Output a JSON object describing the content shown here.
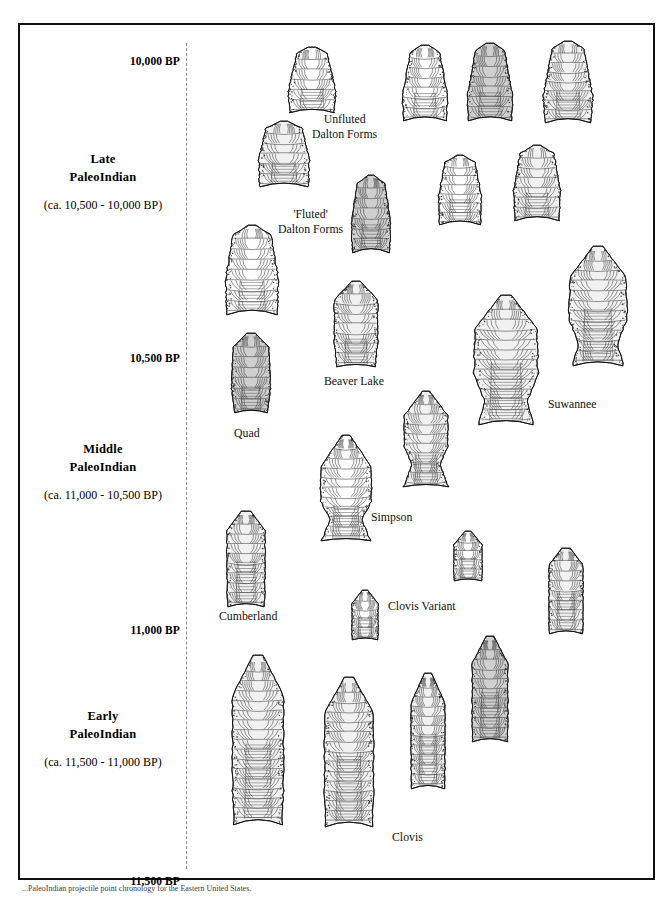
{
  "figure": {
    "caption": "...PaleoIndian projectile point chronology for the Eastern United States.",
    "axis_unit": "BP"
  },
  "axis": {
    "ticks": [
      {
        "label": "10,000 BP",
        "value": 10000,
        "y": 38
      },
      {
        "label": "10,500 BP",
        "value": 10500,
        "y": 335
      },
      {
        "label": "11,000 BP",
        "value": 11000,
        "y": 607
      },
      {
        "label": "11,500 BP",
        "value": 11500,
        "y": 858
      }
    ]
  },
  "periods": [
    {
      "id": "late",
      "name_line1": "Late",
      "name_line2": "PaleoIndian",
      "range": "(ca. 10,500 - 10,000 BP)",
      "start_bp": 10500,
      "end_bp": 10000,
      "top": 125
    },
    {
      "id": "middle",
      "name_line1": "Middle",
      "name_line2": "PaleoIndian",
      "range": "(ca. 11,000 - 10,500 BP)",
      "start_bp": 11000,
      "end_bp": 10500,
      "top": 415
    },
    {
      "id": "early",
      "name_line1": "Early",
      "name_line2": "PaleoIndian",
      "range": "(ca. 11,500 - 11,000 BP)",
      "start_bp": 11500,
      "end_bp": 11000,
      "top": 682
    }
  ],
  "point_labels": [
    {
      "id": "unfluted-dalton",
      "line1": "Unfluted",
      "line2": "Dalton Forms",
      "x": 310,
      "y": 110
    },
    {
      "id": "fluted-dalton",
      "line1": "'Fluted'",
      "line2": "Dalton Forms",
      "x": 276,
      "y": 205
    },
    {
      "id": "beaver-lake",
      "line1": "Beaver Lake",
      "line2": "",
      "x": 322,
      "y": 372
    },
    {
      "id": "quad",
      "line1": "Quad",
      "line2": "",
      "x": 232,
      "y": 424
    },
    {
      "id": "suwannee",
      "line1": "Suwannee",
      "line2": "",
      "x": 546,
      "y": 395
    },
    {
      "id": "simpson",
      "line1": "Simpson",
      "line2": "",
      "x": 369,
      "y": 508
    },
    {
      "id": "cumberland",
      "line1": "Cumberland",
      "line2": "",
      "x": 217,
      "y": 607
    },
    {
      "id": "clovis-variant",
      "line1": "Clovis Variant",
      "line2": "",
      "x": 386,
      "y": 597
    },
    {
      "id": "clovis",
      "line1": "Clovis",
      "line2": "",
      "x": 390,
      "y": 828
    }
  ],
  "artifacts": [
    {
      "id": "dalton-unfluted-1",
      "type": "dalton-unfluted",
      "group": "unfluted-dalton",
      "x": 285,
      "y": 44,
      "w": 50,
      "h": 68,
      "tone": "light"
    },
    {
      "id": "dalton-unfluted-2",
      "type": "dalton-unfluted",
      "group": "unfluted-dalton",
      "x": 399,
      "y": 42,
      "w": 48,
      "h": 78,
      "tone": "light"
    },
    {
      "id": "dalton-unfluted-3",
      "type": "dalton-unfluted",
      "group": "unfluted-dalton",
      "x": 464,
      "y": 40,
      "w": 48,
      "h": 80,
      "tone": "dark"
    },
    {
      "id": "dalton-unfluted-4",
      "type": "dalton-unfluted",
      "group": "unfluted-dalton",
      "x": 540,
      "y": 38,
      "w": 52,
      "h": 84,
      "tone": "mid"
    },
    {
      "id": "dalton-fluted-1",
      "type": "dalton-fluted",
      "group": "fluted-dalton",
      "x": 255,
      "y": 118,
      "w": 54,
      "h": 68,
      "tone": "mid"
    },
    {
      "id": "dalton-fluted-2",
      "type": "dalton-fluted",
      "group": "fluted-dalton",
      "x": 348,
      "y": 172,
      "w": 42,
      "h": 80,
      "tone": "dark"
    },
    {
      "id": "dalton-fluted-3",
      "type": "dalton-fluted",
      "group": "fluted-dalton",
      "x": 435,
      "y": 152,
      "w": 46,
      "h": 72,
      "tone": "light"
    },
    {
      "id": "dalton-fluted-4",
      "type": "dalton-fluted",
      "group": "fluted-dalton",
      "x": 510,
      "y": 142,
      "w": 50,
      "h": 78,
      "tone": "mid"
    },
    {
      "id": "dalton-large-1",
      "type": "dalton-fluted",
      "group": "fluted-dalton",
      "x": 222,
      "y": 222,
      "w": 56,
      "h": 92,
      "tone": "light"
    },
    {
      "id": "quad-1",
      "type": "quad",
      "group": "quad",
      "x": 228,
      "y": 330,
      "w": 42,
      "h": 82,
      "tone": "dark"
    },
    {
      "id": "beaver-lake-1",
      "type": "beaver-lake",
      "group": "beaver-lake",
      "x": 330,
      "y": 278,
      "w": 48,
      "h": 88,
      "tone": "mid"
    },
    {
      "id": "simpson-1",
      "type": "simpson",
      "group": "simpson",
      "x": 316,
      "y": 432,
      "w": 56,
      "h": 108,
      "tone": "light"
    },
    {
      "id": "simpson-2",
      "type": "simpson-waisted",
      "group": "simpson",
      "x": 400,
      "y": 388,
      "w": 48,
      "h": 98,
      "tone": "mid"
    },
    {
      "id": "suwannee-1",
      "type": "suwannee",
      "group": "suwannee",
      "x": 470,
      "y": 292,
      "w": 68,
      "h": 132,
      "tone": "mid"
    },
    {
      "id": "suwannee-2",
      "type": "suwannee",
      "group": "suwannee",
      "x": 565,
      "y": 243,
      "w": 62,
      "h": 122,
      "tone": "mid"
    },
    {
      "id": "cumberland-1",
      "type": "cumberland",
      "group": "cumberland",
      "x": 223,
      "y": 508,
      "w": 42,
      "h": 98,
      "tone": "mid"
    },
    {
      "id": "clovis-variant-1",
      "type": "clovis-small",
      "group": "clovis-variant",
      "x": 450,
      "y": 528,
      "w": 32,
      "h": 52,
      "tone": "light"
    },
    {
      "id": "clovis-variant-2",
      "type": "clovis-small",
      "group": "clovis-variant",
      "x": 348,
      "y": 587,
      "w": 30,
      "h": 52,
      "tone": "light"
    },
    {
      "id": "clovis-variant-3",
      "type": "cumberland",
      "group": "clovis-variant",
      "x": 545,
      "y": 545,
      "w": 38,
      "h": 88,
      "tone": "mid"
    },
    {
      "id": "clovis-1",
      "type": "clovis",
      "group": "clovis",
      "x": 228,
      "y": 652,
      "w": 56,
      "h": 172,
      "tone": "mid"
    },
    {
      "id": "clovis-2",
      "type": "clovis",
      "group": "clovis",
      "x": 320,
      "y": 674,
      "w": 54,
      "h": 152,
      "tone": "mid"
    },
    {
      "id": "clovis-3",
      "type": "clovis-narrow",
      "group": "clovis",
      "x": 407,
      "y": 670,
      "w": 38,
      "h": 118,
      "tone": "mid"
    },
    {
      "id": "clovis-4",
      "type": "clovis-narrow",
      "group": "clovis",
      "x": 468,
      "y": 633,
      "w": 40,
      "h": 108,
      "tone": "dark"
    }
  ],
  "colors": {
    "frame": "#111111",
    "axis_dash": "#8a8fa3",
    "ink": "#111111",
    "fill_light": "#fdfdfd",
    "fill_mid": "#f1f1f1",
    "fill_dark": "#cfcfcf"
  }
}
